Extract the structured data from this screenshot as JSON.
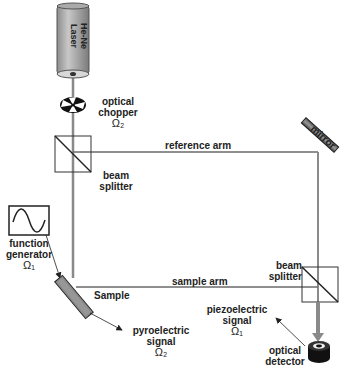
{
  "diagram": {
    "laser": {
      "label_line1": "He-Ne",
      "label_line2": "Laser"
    },
    "chopper": {
      "label_line1": "optical",
      "label_line2": "chopper",
      "freq": "Ω₂"
    },
    "beam_splitter_1": {
      "label_line1": "beam",
      "label_line2": "splitter"
    },
    "reference_arm": {
      "label": "reference arm"
    },
    "mirror": {
      "label": "mirror"
    },
    "function_generator": {
      "label_line1": "function",
      "label_line2": "generator",
      "freq": "Ω₁"
    },
    "sample": {
      "label": "Sample"
    },
    "sample_arm": {
      "label": "sample arm"
    },
    "beam_splitter_2": {
      "label_line1": "beam",
      "label_line2": "splitter"
    },
    "pyroelectric": {
      "label_line1": "pyroelectric",
      "label_line2": "signal",
      "freq": "Ω₂"
    },
    "piezoelectric": {
      "label_line1": "piezoelectric",
      "label_line2": "signal",
      "freq": "Ω₁"
    },
    "detector": {
      "label_line1": "optical",
      "label_line2": "detector"
    }
  },
  "colors": {
    "beam": "#8a8a8a",
    "line": "#555555",
    "laser_body": "#9a9a9a",
    "sample_fill": "#888888"
  }
}
